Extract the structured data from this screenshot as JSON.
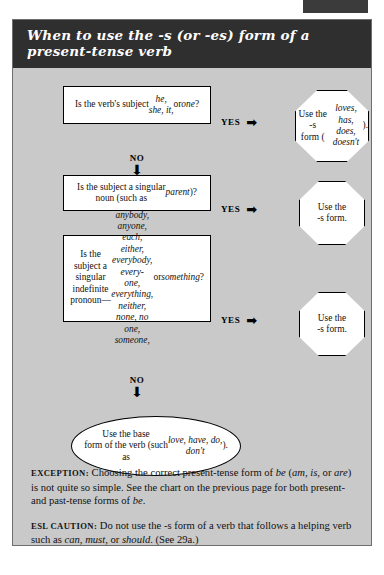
{
  "page_marker": {
    "name": "page-edge-marker",
    "color": "#3b3b3b"
  },
  "panel": {
    "background": "#c9c9c9",
    "border_color": "#6e6e6e",
    "header_background": "#2f2f2f",
    "header_text_color": "#ffffff"
  },
  "header": {
    "title_line1": "When to use the -s (or -es) form of a",
    "title_line2": "present-tense verb"
  },
  "flow": {
    "yes_label": "YES",
    "no_label": "NO",
    "arrow_right": "➡",
    "arrow_down": "⬇",
    "steps": [
      {
        "id": "step-1",
        "question_html": "Is the verb's subject <em>he,<br>she, it,</em> or <em>one</em>?",
        "question_text": "Is the verb's subject he, she, it, or one?",
        "result_html": "Use the -s<br>form (<em>loves,<br>has, does,<br>doesn't</em>).",
        "result_text": "Use the -s form (loves, has, does, doesn't).",
        "result_shape": "octagon"
      },
      {
        "id": "step-2",
        "question_html": "Is the subject a singular<br>noun (such as <em>parent</em>)?",
        "question_text": "Is the subject a singular noun (such as parent)?",
        "result_html": "Use the<br>-s form.",
        "result_text": "Use the -s form.",
        "result_shape": "octagon"
      },
      {
        "id": "step-3",
        "question_html": "Is the subject a singular<br>indefinite pronoun&mdash;<br><em>anybody, anyone, each,<br>either, everybody, every-<br>one, everything, neither,<br>none, no one, someone,</em> or<br><em>something</em>?",
        "question_text": "Is the subject a singular indefinite pronoun—anybody, anyone, each, either, everybody, everyone, everything, neither, none, no one, someone, or something?",
        "result_html": "Use the<br>-s form.",
        "result_text": "Use the -s form.",
        "result_shape": "octagon"
      }
    ],
    "final": {
      "id": "final-outcome",
      "text_html": "Use the base<br>form of the verb (such<br>as <em>love, have, do,<br>don't</em>).",
      "text": "Use the base form of the verb (such as love, have, do, don't).",
      "shape": "oval"
    }
  },
  "notes": [
    {
      "id": "exception-note",
      "label": "EXCEPTION:",
      "body_html": "&nbsp;Choosing the correct present-tense form of <em>be</em> (<em>am, is,</em> or <em>are</em>) is not quite so simple. See the chart on the previous page for both present- and past-tense forms of <em>be</em>.",
      "body_text": "Choosing the correct present-tense form of be (am, is, or are) is not quite so simple. See the chart on the previous page for both present- and past-tense forms of be."
    },
    {
      "id": "esl-caution-note",
      "label": "ESL CAUTION:",
      "body_html": "&nbsp;Do not use the -s form of a verb that follows a helping verb such as <em>can, must,</em> or <em>should</em>. (See 29a.)",
      "body_text": "Do not use the -s form of a verb that follows a helping verb such as can, must, or should. (See 29a.)"
    }
  ]
}
